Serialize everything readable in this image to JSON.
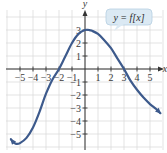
{
  "chart_data": {
    "type": "line",
    "title": "",
    "xlabel": "x",
    "ylabel": "y",
    "xlim": [
      -6.5,
      6.5
    ],
    "ylim": [
      -6,
      4.5
    ],
    "grid": true,
    "x_ticks": [
      -5,
      -4,
      -3,
      -2,
      -1,
      1,
      2,
      3,
      4,
      5
    ],
    "y_ticks": [
      -5,
      -4,
      -3,
      -2,
      -1,
      1,
      2,
      3
    ],
    "x_tick_labels": [
      "−5",
      "−4",
      "−3",
      "−2",
      "−1",
      "1",
      "2",
      "3",
      "4",
      "5"
    ],
    "y_tick_labels": [
      "−5",
      "−4",
      "−3",
      "−2",
      "−1",
      "1",
      "2",
      "3"
    ],
    "series": [
      {
        "name": "y = f(x)",
        "color": "#3d5a8c",
        "x": [
          -5.7,
          -5.5,
          -5.3,
          -5.0,
          -4.5,
          -4.0,
          -3.5,
          -3.0,
          -2.5,
          -2.0,
          -1.5,
          -1.0,
          -0.5,
          0.0,
          0.3,
          0.5,
          1.0,
          1.5,
          2.0,
          2.5,
          3.0,
          3.5,
          4.0,
          4.5,
          5.0,
          5.5,
          5.8
        ],
        "y": [
          -5.4,
          -5.65,
          -5.75,
          -5.7,
          -5.3,
          -4.5,
          -3.3,
          -1.9,
          -0.8,
          0.0,
          1.0,
          2.0,
          2.7,
          3.0,
          3.0,
          2.95,
          2.7,
          2.2,
          1.6,
          0.8,
          0.0,
          -0.9,
          -1.6,
          -2.2,
          -2.7,
          -3.1,
          -3.4
        ]
      }
    ],
    "key_points": {
      "x_intercepts": [
        -2,
        3
      ],
      "y_intercept": 3,
      "local_max": [
        0.1,
        3
      ],
      "local_min": [
        -5.3,
        -5.75
      ]
    },
    "annotations": [
      {
        "text": "y = f[x]",
        "position": "upper right",
        "style": "callout"
      }
    ],
    "legend": "none"
  },
  "labels": {
    "x_axis": "x",
    "y_axis": "y",
    "callout": "y = f[x]"
  },
  "colors": {
    "curve": "#3d5a8c",
    "grid": "#dcdcdc",
    "axis": "#333333",
    "callout_fill": "#dbe9f3",
    "callout_stroke": "#b6cfe2"
  }
}
